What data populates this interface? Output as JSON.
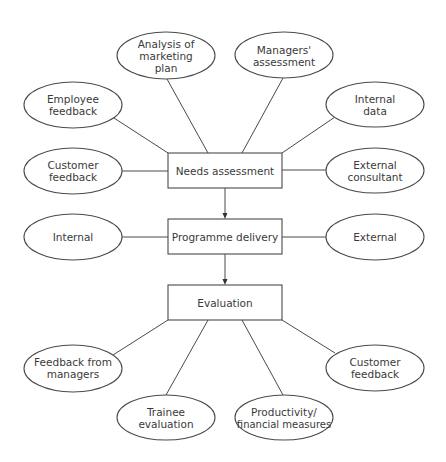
{
  "diagram": {
    "type": "flowchart",
    "colors": {
      "line": "#4a4a4a",
      "text": "#3a3a3a",
      "background": "#ffffff"
    },
    "main_flow": [
      {
        "id": "needs",
        "label": "Needs assessment"
      },
      {
        "id": "delivery",
        "label": "Programme delivery"
      },
      {
        "id": "evaluation",
        "label": "Evaluation"
      }
    ],
    "needs_inputs": [
      {
        "id": "employee_feedback",
        "lines": [
          "Employee",
          "feedback"
        ]
      },
      {
        "id": "analysis_marketing",
        "lines": [
          "Analysis of",
          "marketing",
          "plan"
        ]
      },
      {
        "id": "managers_assessment",
        "lines": [
          "Managers'",
          "assessment"
        ]
      },
      {
        "id": "internal_data",
        "lines": [
          "Internal",
          "data"
        ]
      },
      {
        "id": "customer_feedback_top",
        "lines": [
          "Customer",
          "feedback"
        ]
      },
      {
        "id": "external_consultant",
        "lines": [
          "External",
          "consultant"
        ]
      }
    ],
    "delivery_options": [
      {
        "id": "internal",
        "lines": [
          "Internal"
        ]
      },
      {
        "id": "external",
        "lines": [
          "External"
        ]
      }
    ],
    "evaluation_methods": [
      {
        "id": "feedback_managers",
        "lines": [
          "Feedback from",
          "managers"
        ]
      },
      {
        "id": "trainee_evaluation",
        "lines": [
          "Trainee",
          "evaluation"
        ]
      },
      {
        "id": "productivity_financial",
        "lines": [
          "Productivity/",
          "financial measures"
        ]
      },
      {
        "id": "customer_feedback_bottom",
        "lines": [
          "Customer",
          "feedback"
        ]
      }
    ]
  }
}
